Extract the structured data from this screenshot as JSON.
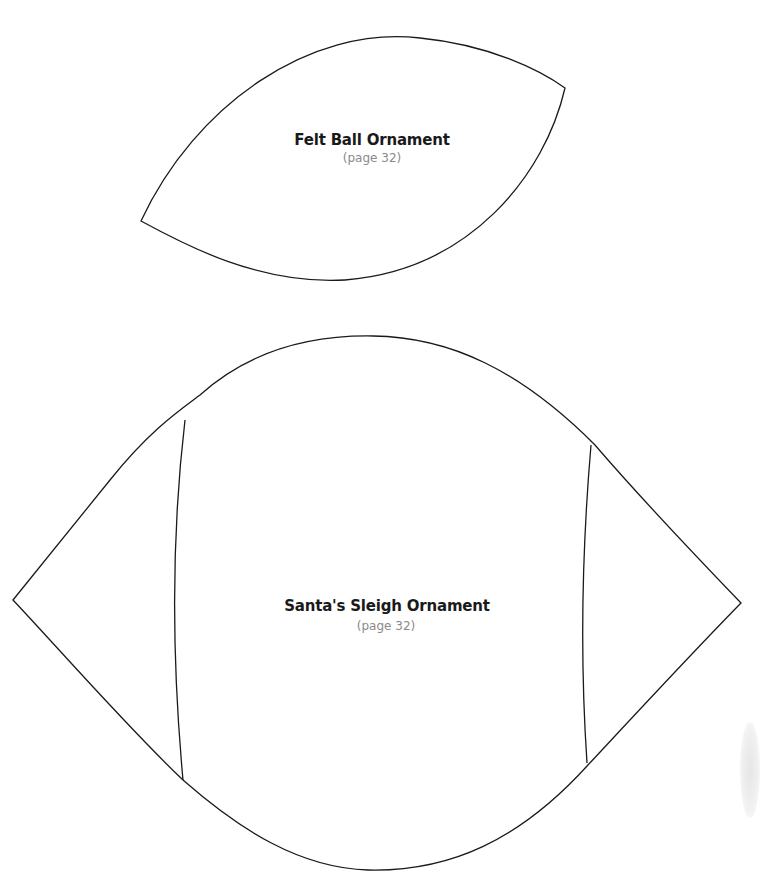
{
  "patterns": [
    {
      "name": "Felt Ball Ornament",
      "page_ref": "(page 32)"
    },
    {
      "name": "Santa's Sleigh Ornament",
      "page_ref": "(page 32)"
    }
  ],
  "colors": {
    "outline": "#1a1a1a",
    "title_text": "#1a1a1a",
    "page_ref_text": "#8a8a8a",
    "background": "#ffffff"
  }
}
